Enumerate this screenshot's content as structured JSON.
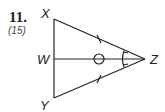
{
  "problem": {
    "number": "11.",
    "reference": "(15)"
  },
  "diagram": {
    "vertices": {
      "X": "X",
      "W": "W",
      "Y": "Y",
      "Z": "Z"
    },
    "segments": [
      "XY",
      "XZ",
      "YZ",
      "WZ"
    ],
    "markings": {
      "XZ_YZ": "single tick (congruent)",
      "angle_XZW_YZW": "double arc ticks (congruent angles)",
      "WZ": "circle marker"
    }
  }
}
